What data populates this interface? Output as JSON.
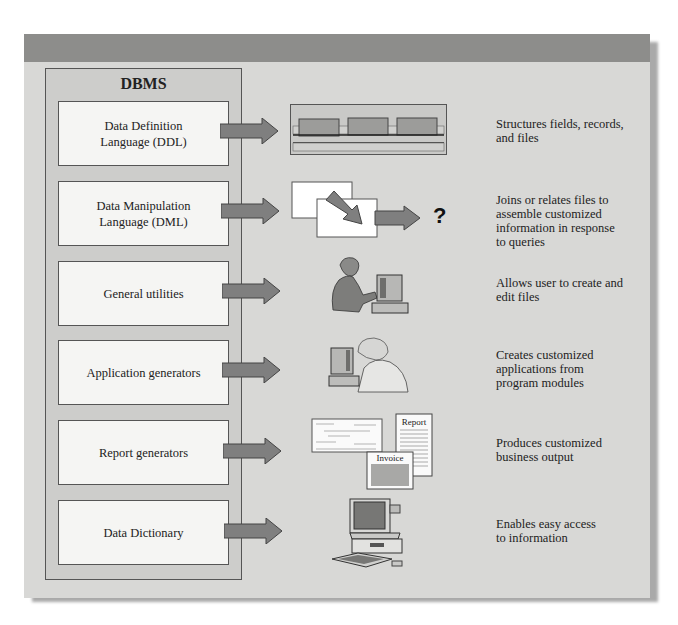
{
  "diagram": {
    "title": "DBMS",
    "components": [
      {
        "label_line1": "Data Definition",
        "label_line2": "Language (DDL)",
        "illustration": "record-structure-icon",
        "description_lines": [
          "Structures fields, records,",
          "and files"
        ]
      },
      {
        "label_line1": "Data Manipulation",
        "label_line2": "Language (DML)",
        "illustration": "joined-files-icon",
        "illustration_text": "?",
        "description_lines": [
          "Joins or relates files to",
          "assemble customized",
          "information in response",
          "to queries"
        ]
      },
      {
        "label_line1": "General utilities",
        "label_line2": "",
        "illustration": "woman-at-computer-icon",
        "description_lines": [
          "Allows user to create and",
          "edit files"
        ]
      },
      {
        "label_line1": "Application generators",
        "label_line2": "",
        "illustration": "man-at-computer-icon",
        "description_lines": [
          "Creates customized",
          "applications from",
          "program modules"
        ]
      },
      {
        "label_line1": "Report generators",
        "label_line2": "",
        "illustration": "report-documents-icon",
        "illustration_labels": {
          "report": "Report",
          "invoice": "Invoice"
        },
        "description_lines": [
          "Produces customized",
          "business output"
        ]
      },
      {
        "label_line1": "Data Dictionary",
        "label_line2": "",
        "illustration": "desktop-computer-icon",
        "description_lines": [
          "Enables easy access",
          "to information"
        ]
      }
    ]
  },
  "colors": {
    "panel": "#d8d8d6",
    "topbar": "#8d8d8b",
    "dbms_box": "#cdcdcb",
    "component_box": "#f5f5f3",
    "arrow_fill": "#7f7f7f"
  }
}
